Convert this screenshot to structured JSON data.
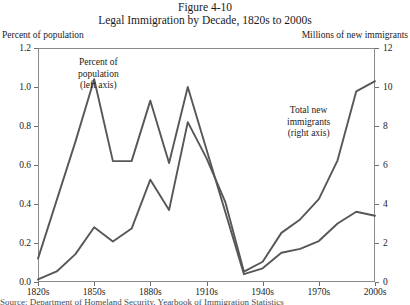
{
  "figure": {
    "number": "Figure 4-10",
    "title": "Legal Immigration by Decade, 1820s to 2000s"
  },
  "axis_captions": {
    "left": "Percent of population",
    "right": "Millions of new immigrants"
  },
  "annotations": {
    "left_series": {
      "line1": "Percent of",
      "line2": "population",
      "line3": "(left axis)"
    },
    "right_series": {
      "line1": "Total new",
      "line2": "immigrants",
      "line3": "(right axis)"
    }
  },
  "colors": {
    "line": "#575757",
    "frame": "#8a8a8a",
    "text": "#1a1a1a"
  },
  "caption": "Source: Department of Homeland Security, Yearbook of Immigration Statistics",
  "chart_data": {
    "type": "line",
    "title": "Legal Immigration by Decade, 1820s to 2000s",
    "xlabel": "",
    "ylabel": "Percent of population",
    "y2label": "Millions of new immigrants",
    "ylim": [
      0,
      1.2
    ],
    "y2lim": [
      0,
      12
    ],
    "grid": false,
    "legend": "annotations-inline",
    "categories": [
      "1820s",
      "1830s",
      "1840s",
      "1850s",
      "1860s",
      "1870s",
      "1880s",
      "1890s",
      "1900s",
      "1910s",
      "1920s",
      "1930s",
      "1940s",
      "1950s",
      "1960s",
      "1970s",
      "1980s",
      "1990s",
      "2000s"
    ],
    "x_tick_labels": [
      "1820s",
      "1850s",
      "1880s",
      "1910s",
      "1940s",
      "1970s",
      "2000s"
    ],
    "y_tick_labels": [
      "0.0",
      "0.2",
      "0.4",
      "0.6",
      "0.8",
      "1.0",
      "1.2"
    ],
    "y2_tick_labels": [
      "0",
      "2",
      "4",
      "6",
      "8",
      "10",
      "12"
    ],
    "series": [
      {
        "name": "Percent of population (left axis)",
        "axis": "left",
        "values": [
          0.12,
          0.42,
          0.72,
          1.04,
          0.62,
          0.62,
          0.93,
          0.61,
          1.0,
          0.68,
          0.36,
          0.04,
          0.07,
          0.15,
          0.17,
          0.21,
          0.3,
          0.36,
          0.34
        ]
      },
      {
        "name": "Total new immigrants (right axis)",
        "axis": "right",
        "values": [
          0.13,
          0.54,
          1.43,
          2.81,
          2.08,
          2.74,
          5.25,
          3.69,
          8.2,
          6.35,
          4.11,
          0.53,
          1.04,
          2.52,
          3.21,
          4.25,
          6.24,
          9.78,
          10.3
        ]
      }
    ]
  }
}
